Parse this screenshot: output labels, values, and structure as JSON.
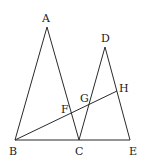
{
  "diagram": {
    "type": "geometry",
    "stroke_color": "#2a2a2a",
    "label_color": "#222222",
    "points": {
      "A": {
        "label": "A",
        "x": 47,
        "y": 27,
        "lx": 42,
        "ly": 22
      },
      "B": {
        "label": "B",
        "x": 15,
        "y": 140,
        "lx": 9,
        "ly": 155
      },
      "C": {
        "label": "C",
        "x": 79,
        "y": 140,
        "lx": 75,
        "ly": 155
      },
      "D": {
        "label": "D",
        "x": 105,
        "y": 47,
        "lx": 101,
        "ly": 42
      },
      "E": {
        "label": "E",
        "x": 130,
        "y": 140,
        "lx": 129,
        "ly": 155
      },
      "F": {
        "label": "F",
        "x": 72,
        "y": 114,
        "lx": 61,
        "ly": 113
      },
      "G": {
        "label": "G",
        "x": 88,
        "y": 105,
        "lx": 80,
        "ly": 102
      },
      "H": {
        "label": "H",
        "x": 117,
        "y": 91,
        "lx": 119,
        "ly": 92
      }
    },
    "segments": [
      {
        "from": "A",
        "to": "B"
      },
      {
        "from": "A",
        "to": "C"
      },
      {
        "from": "B",
        "to": "E"
      },
      {
        "from": "D",
        "to": "C"
      },
      {
        "from": "D",
        "to": "E"
      },
      {
        "from": "B",
        "to": "H"
      }
    ]
  }
}
